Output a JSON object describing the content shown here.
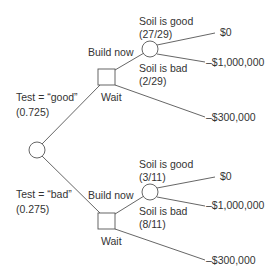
{
  "diagram": {
    "type": "decision-tree",
    "root": {
      "kind": "chance",
      "branches": [
        {
          "label": "Test = “good”",
          "probability": "(0.725)",
          "decision": {
            "kind": "decision",
            "options": [
              {
                "label": "Build now",
                "chance": {
                  "kind": "chance",
                  "outcomes": [
                    {
                      "label": "Soil is good",
                      "probability": "(27/29)",
                      "payoff": "$0"
                    },
                    {
                      "label": "Soil is bad",
                      "probability": "(2/29)",
                      "payoff": "–$1,000,000"
                    }
                  ]
                }
              },
              {
                "label": "Wait",
                "payoff": "–$300,000"
              }
            ]
          }
        },
        {
          "label": "Test = “bad”",
          "probability": "(0.275)",
          "decision": {
            "kind": "decision",
            "options": [
              {
                "label": "Build now",
                "chance": {
                  "kind": "chance",
                  "outcomes": [
                    {
                      "label": "Soil is good",
                      "probability": "(3/11)",
                      "payoff": "$0"
                    },
                    {
                      "label": "Soil is bad",
                      "probability": "(8/11)",
                      "payoff": "–$1,000,000"
                    }
                  ]
                }
              },
              {
                "label": "Wait",
                "payoff": "–$300,000"
              }
            ]
          }
        }
      ]
    }
  }
}
